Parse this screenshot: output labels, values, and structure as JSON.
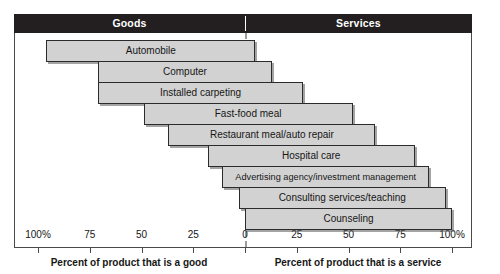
{
  "header": {
    "goods_label": "Goods",
    "services_label": "Services"
  },
  "axis": {
    "left_caption": "Percent of product that is a good",
    "right_caption": "Percent of product that is a service",
    "tick_labels": [
      "100%",
      "75",
      "50",
      "25",
      "0",
      "25",
      "50",
      "75",
      "100%"
    ]
  },
  "chart_data": {
    "type": "bar",
    "subtitle": "",
    "orientation": "horizontal",
    "xlabel": "Percent of product that is a good / Percent of product that is a service",
    "ylabel": "",
    "xlim": [
      -100,
      100
    ],
    "grid": false,
    "legend": null,
    "zero_reference_line": 0,
    "axis_ticks": [
      -100,
      -75,
      -50,
      -25,
      0,
      25,
      50,
      75,
      100
    ],
    "axis_tick_labels": [
      "100%",
      "75",
      "50",
      "25",
      "0",
      "25",
      "50",
      "75",
      "100%"
    ],
    "categories": [
      "Automobile",
      "Computer",
      "Installed carpeting",
      "Fast-food meal",
      "Restaurant meal/auto repair",
      "Hospital care",
      "Advertising agency/investment management",
      "Consulting services/teaching",
      "Counseling"
    ],
    "series": [
      {
        "name": "Percent good",
        "values": [
          96,
          71,
          71,
          49,
          37,
          18,
          11,
          3,
          0
        ]
      },
      {
        "name": "Percent service",
        "values": [
          5,
          13,
          28,
          52,
          63,
          82,
          89,
          97,
          100
        ]
      }
    ],
    "bars": [
      {
        "label": "Automobile",
        "start": -96,
        "end": 5,
        "good": 96,
        "service": 5
      },
      {
        "label": "Computer",
        "start": -71,
        "end": 13,
        "good": 71,
        "service": 13
      },
      {
        "label": "Installed carpeting",
        "start": -71,
        "end": 28,
        "good": 71,
        "service": 28
      },
      {
        "label": "Fast-food meal",
        "start": -49,
        "end": 52,
        "good": 49,
        "service": 52
      },
      {
        "label": "Restaurant meal/auto repair",
        "start": -37,
        "end": 63,
        "good": 37,
        "service": 63
      },
      {
        "label": "Hospital care",
        "start": -18,
        "end": 82,
        "good": 18,
        "service": 82
      },
      {
        "label": "Advertising agency/investment management",
        "start": -11,
        "end": 89,
        "good": 11,
        "service": 89
      },
      {
        "label": "Consulting services/teaching",
        "start": -3,
        "end": 97,
        "good": 3,
        "service": 97
      },
      {
        "label": "Counseling",
        "start": 0,
        "end": 100,
        "good": 0,
        "service": 100
      }
    ]
  },
  "colors": {
    "header_band": "#231f20",
    "header_text": "#ffffff",
    "bar_fill": "#d2d2d2",
    "bar_stroke": "#2b2b2b",
    "zero_line": "#9b9b9b",
    "frame": "#4a4a4a",
    "text": "#161616",
    "background": "#ffffff"
  }
}
